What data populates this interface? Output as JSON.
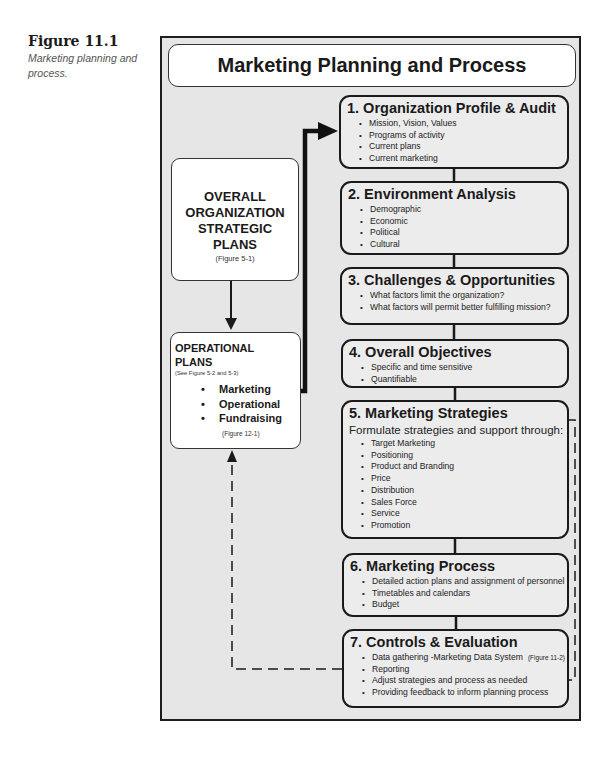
{
  "caption": {
    "number": "Figure 11.1",
    "text": "Marketing planning and process."
  },
  "diagram": {
    "title": "Marketing Planning and Process",
    "overall_plans": {
      "title": "OVERALL ORGANIZATION STRATEGIC PLANS",
      "lines": [
        "OVERALL",
        "ORGANIZATION",
        "STRATEGIC",
        "PLANS"
      ],
      "ref": "(Figure 5-1)"
    },
    "operational_plans": {
      "lines": [
        "OPERATIONAL",
        "PLANS"
      ],
      "ref": "(See Figure 5-2 and 5-3)",
      "items": [
        "Marketing",
        "Operational",
        "Fundraising"
      ],
      "ref2": "(Figure 12-1)"
    },
    "steps": [
      {
        "title": "1. Organization Profile & Audit",
        "items": [
          "Mission, Vision, Values",
          "Programs of activity",
          "Current plans",
          "Current marketing"
        ]
      },
      {
        "title": "2. Environment Analysis",
        "items": [
          "Demographic",
          "Economic",
          "Political",
          "Cultural"
        ]
      },
      {
        "title": "3. Challenges & Opportunities",
        "items": [
          "What factors limit the organization?",
          "What factors will permit better fulfilling mission?"
        ]
      },
      {
        "title": "4. Overall Objectives",
        "items": [
          "Specific and time sensitive",
          "Quantifiable"
        ]
      },
      {
        "title": "5. Marketing Strategies",
        "subtitle": "Formulate strategies and support through:",
        "items": [
          "Target Marketing",
          "Positioning",
          "Product and Branding",
          "Price",
          "Distribution",
          "Sales Force",
          "Service",
          "Promotion"
        ]
      },
      {
        "title": "6. Marketing Process",
        "items": [
          "Detailed action plans and assignment of personnel",
          "Timetables and calendars",
          "Budget"
        ]
      },
      {
        "title": "7. Controls & Evaluation",
        "items": [
          "Data gathering -Marketing Data System",
          "Reporting",
          "Adjust strategies and process as needed",
          "Providing feedback to inform planning process"
        ],
        "item_refs": {
          "0": "(Figure 11-2)"
        }
      }
    ]
  }
}
